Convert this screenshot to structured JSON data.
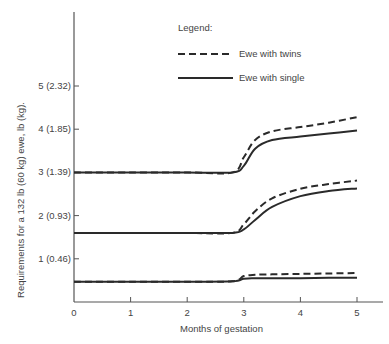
{
  "chart_data": {
    "type": "line",
    "title": "",
    "xlabel": "Months of gestation",
    "ylabel": "Requirements for a 132 lb (60 kg) ewe, lb (kg).",
    "xlim": [
      0,
      5
    ],
    "ylim": [
      0,
      6
    ],
    "x_ticks": [
      "0",
      "1",
      "2",
      "3",
      "4",
      "5"
    ],
    "y_ticks": [
      {
        "value": 1,
        "label": "1 (0.46)"
      },
      {
        "value": 2,
        "label": "2 (0.93)"
      },
      {
        "value": 3,
        "label": "3 (1.39)"
      },
      {
        "value": 4,
        "label": "4 (1.85)"
      },
      {
        "value": 5,
        "label": "5 (2.32)"
      }
    ],
    "grid": false,
    "legend": {
      "title": "Legend:",
      "position": "upper right",
      "entries": [
        {
          "label": "Ewe with twins",
          "style": "dashed"
        },
        {
          "label": "Ewe with single",
          "style": "solid"
        }
      ]
    },
    "x": [
      0,
      1,
      2,
      2.8,
      3.0,
      3.2,
      3.5,
      4.0,
      4.5,
      5.0
    ],
    "series": [
      {
        "name": "Ewe with twins (upper group)",
        "style": "dashed",
        "values": [
          3.0,
          3.0,
          3.0,
          3.0,
          3.35,
          3.75,
          3.95,
          4.05,
          4.15,
          4.28
        ]
      },
      {
        "name": "Ewe with single (upper group)",
        "style": "solid",
        "values": [
          3.0,
          3.0,
          3.0,
          3.0,
          3.15,
          3.55,
          3.75,
          3.83,
          3.9,
          3.97
        ]
      },
      {
        "name": "Ewe with twins (middle group)",
        "style": "dashed",
        "values": [
          1.6,
          1.6,
          1.6,
          1.6,
          1.8,
          2.1,
          2.4,
          2.62,
          2.73,
          2.81
        ]
      },
      {
        "name": "Ewe with single (middle group)",
        "style": "solid",
        "values": [
          1.6,
          1.6,
          1.6,
          1.6,
          1.68,
          1.9,
          2.2,
          2.45,
          2.57,
          2.63
        ]
      },
      {
        "name": "Ewe with twins (lower group)",
        "style": "dashed",
        "values": [
          0.47,
          0.47,
          0.47,
          0.48,
          0.6,
          0.63,
          0.64,
          0.65,
          0.66,
          0.67
        ]
      },
      {
        "name": "Ewe with single (lower group)",
        "style": "solid",
        "values": [
          0.47,
          0.47,
          0.47,
          0.48,
          0.54,
          0.55,
          0.55,
          0.55,
          0.56,
          0.56
        ]
      }
    ]
  },
  "plot": {
    "origin_x": 74,
    "origin_y": 302,
    "x_scale": 56.6,
    "y_scale": 43.2,
    "axis_top": 12,
    "axis_right": 383
  },
  "colors": {
    "line": "#2a2a2a",
    "axis": "#555555",
    "text": "#444444"
  }
}
